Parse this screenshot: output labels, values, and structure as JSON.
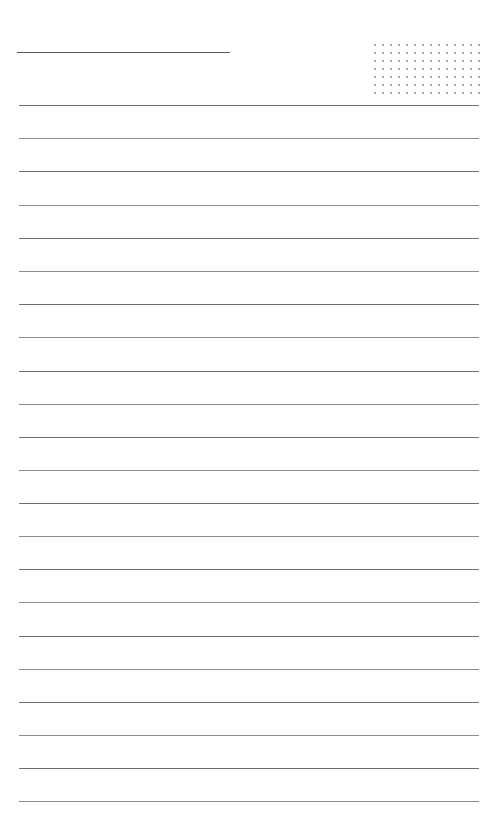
{
  "page": {
    "type": "lined-notepaper",
    "background_color": "#ffffff",
    "line_color": "#6e6e6e",
    "dot_color": "#8a8a8a"
  },
  "header": {
    "title_line": {
      "x": 17,
      "y": 52,
      "width": 213
    },
    "dot_grid": {
      "columns": 14,
      "rows": 7,
      "x": 371,
      "y": 41,
      "spacing": 8
    }
  },
  "rules": {
    "count": 22,
    "x": 19,
    "width": 460,
    "y_positions": [
      105,
      138,
      171,
      205,
      238,
      271,
      304,
      337,
      371,
      404,
      437,
      470,
      503,
      536,
      569,
      602,
      636,
      669,
      702,
      735,
      768,
      801
    ]
  }
}
